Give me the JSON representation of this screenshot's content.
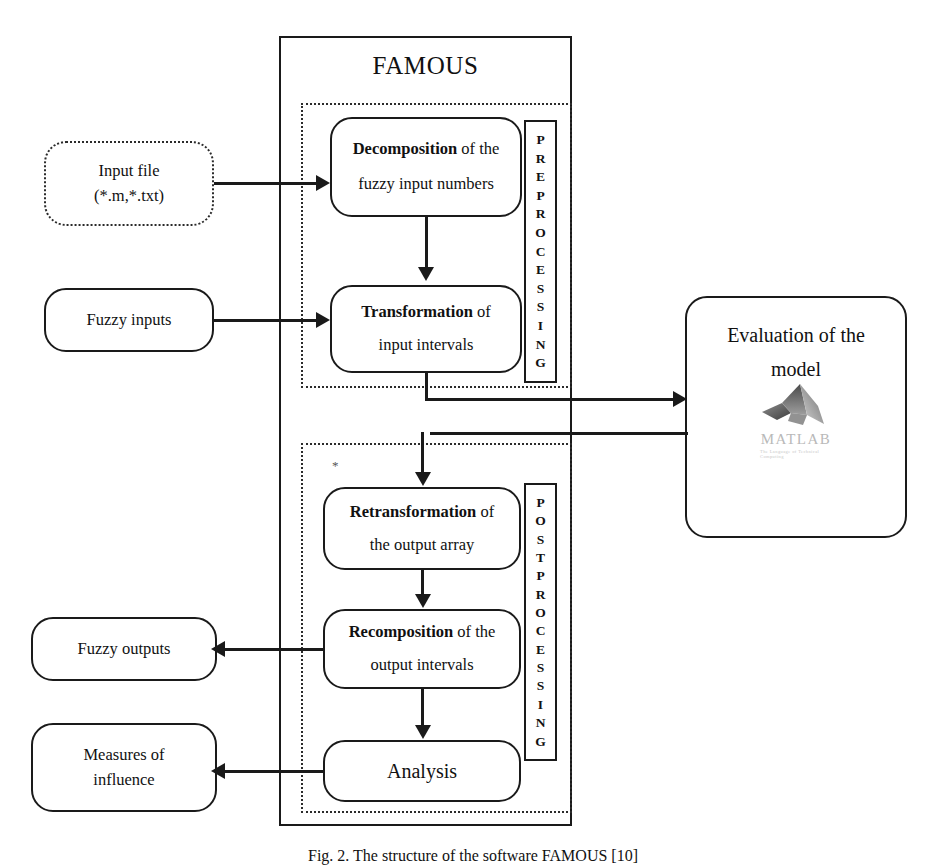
{
  "figure": {
    "title": "FAMOUS",
    "caption": "Fig. 2.  The structure of the software FAMOUS [10]"
  },
  "inputs": [
    {
      "name": "input-file",
      "line1": "Input file",
      "line2": "(*.m,*.txt)",
      "style": "dotted"
    },
    {
      "name": "fuzzy-inputs",
      "line1": "Fuzzy inputs",
      "line2": "",
      "style": "solid"
    }
  ],
  "preprocessing": {
    "band_label": "PREPROCESSING",
    "band_letters": [
      "P",
      "R",
      "E",
      "P",
      "R",
      "O",
      "C",
      "E",
      "S",
      "S",
      "I",
      "N",
      "G"
    ],
    "steps": [
      {
        "name": "decomposition",
        "lead": "Decomposition",
        "rest": " of the",
        "line2": "fuzzy  input numbers"
      },
      {
        "name": "transformation",
        "lead": "Transformation",
        "rest": " of",
        "line2": "input intervals"
      }
    ]
  },
  "postprocessing": {
    "band_label": "POSTPROCESSING",
    "band_letters": [
      "P",
      "O",
      "S",
      "T",
      "P",
      "R",
      "O",
      "C",
      "E",
      "S",
      "S",
      "I",
      "N",
      "G"
    ],
    "steps": [
      {
        "name": "retransformation",
        "lead": "Retransformation",
        "rest": " of",
        "line2": "the output array"
      },
      {
        "name": "recomposition",
        "lead": "Recomposition",
        "rest": " of the",
        "line2": "output intervals"
      },
      {
        "name": "analysis",
        "lead": "",
        "rest": "Analysis",
        "line2": ""
      }
    ],
    "marker": "*"
  },
  "evaluation": {
    "line1": "Evaluation of the",
    "line2": "model",
    "logo_wordmark": "MATLAB",
    "logo_tagline": "The Language of Technical Computing"
  },
  "outputs": [
    {
      "name": "fuzzy-outputs",
      "line1": "Fuzzy outputs",
      "line2": ""
    },
    {
      "name": "measures-of-influence",
      "line1": "Measures of",
      "line2": "influence"
    }
  ],
  "colors": {
    "stroke": "#1a1a1a",
    "dotted": "#2b2b2b",
    "background": "#ffffff",
    "logo_word": "#b9b9b9"
  }
}
